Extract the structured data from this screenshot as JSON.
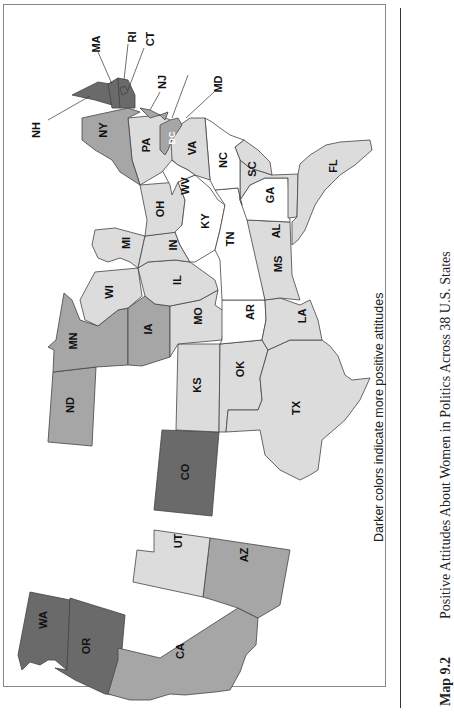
{
  "figure": {
    "number": "Map 9.2",
    "title": "Positive Attitudes About Women in Politics Across 38 U.S. States",
    "legend_note": "Darker colors indicate more positive attitudes",
    "orientation": "rotated 90° clockwise (north at left)"
  },
  "shades": {
    "none": "#ffffff",
    "light": "#dcdcdc",
    "medium": "#a6a6a6",
    "dark": "#6a6a6a"
  },
  "states": [
    {
      "abbr": "WA",
      "shade": "dark"
    },
    {
      "abbr": "OR",
      "shade": "dark"
    },
    {
      "abbr": "CA",
      "shade": "medium"
    },
    {
      "abbr": "AZ",
      "shade": "medium"
    },
    {
      "abbr": "UT",
      "shade": "light"
    },
    {
      "abbr": "CO",
      "shade": "dark"
    },
    {
      "abbr": "ND",
      "shade": "medium"
    },
    {
      "abbr": "MN",
      "shade": "medium"
    },
    {
      "abbr": "IA",
      "shade": "medium"
    },
    {
      "abbr": "KS",
      "shade": "light"
    },
    {
      "abbr": "OK",
      "shade": "light"
    },
    {
      "abbr": "TX",
      "shade": "light"
    },
    {
      "abbr": "MO",
      "shade": "light"
    },
    {
      "abbr": "AR",
      "shade": "none"
    },
    {
      "abbr": "LA",
      "shade": "light"
    },
    {
      "abbr": "WI",
      "shade": "light"
    },
    {
      "abbr": "IL",
      "shade": "light"
    },
    {
      "abbr": "MI",
      "shade": "light"
    },
    {
      "abbr": "IN",
      "shade": "light"
    },
    {
      "abbr": "OH",
      "shade": "light"
    },
    {
      "abbr": "KY",
      "shade": "none"
    },
    {
      "abbr": "TN",
      "shade": "none"
    },
    {
      "abbr": "MS",
      "shade": "light"
    },
    {
      "abbr": "AL",
      "shade": "none"
    },
    {
      "abbr": "GA",
      "shade": "light"
    },
    {
      "abbr": "FL",
      "shade": "light"
    },
    {
      "abbr": "SC",
      "shade": "light"
    },
    {
      "abbr": "NC",
      "shade": "none"
    },
    {
      "abbr": "VA",
      "shade": "light"
    },
    {
      "abbr": "WV",
      "shade": "none"
    },
    {
      "abbr": "PA",
      "shade": "light"
    },
    {
      "abbr": "NY",
      "shade": "medium"
    },
    {
      "abbr": "NJ",
      "shade": "medium"
    },
    {
      "abbr": "MD",
      "shade": "medium"
    },
    {
      "abbr": "DC",
      "shade": "medium"
    },
    {
      "abbr": "NH",
      "shade": "dark"
    },
    {
      "abbr": "MA",
      "shade": "dark"
    },
    {
      "abbr": "RI",
      "shade": "dark"
    },
    {
      "abbr": "CT",
      "shade": "dark"
    }
  ],
  "callouts": [
    "NH",
    "MA",
    "RI",
    "CT",
    "NJ",
    "MD"
  ]
}
